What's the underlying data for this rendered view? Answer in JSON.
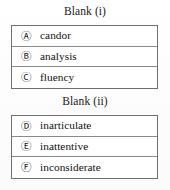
{
  "page": {
    "background_color": "#ffffff",
    "text_color": "#111111",
    "border_color": "#6f6f6f",
    "divider_color": "#8a8a8a"
  },
  "groups": [
    {
      "id": "blank-i",
      "title": "Blank (i)",
      "options": [
        {
          "marker": "Ⓐ",
          "letter": "A",
          "label": "candor"
        },
        {
          "marker": "Ⓑ",
          "letter": "B",
          "label": "analysis"
        },
        {
          "marker": "Ⓒ",
          "letter": "C",
          "label": "fluency"
        }
      ]
    },
    {
      "id": "blank-ii",
      "title": "Blank (ii)",
      "options": [
        {
          "marker": "Ⓓ",
          "letter": "D",
          "label": "inarticulate"
        },
        {
          "marker": "Ⓔ",
          "letter": "E",
          "label": "inattentive"
        },
        {
          "marker": "Ⓕ",
          "letter": "F",
          "label": "inconsiderate"
        }
      ]
    }
  ]
}
